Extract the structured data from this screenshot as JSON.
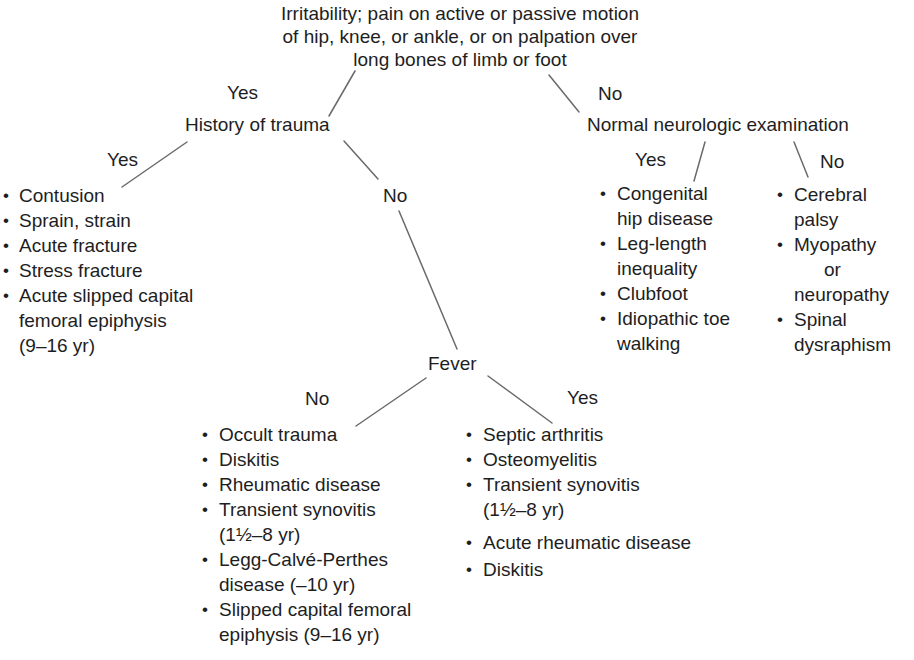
{
  "diagram": {
    "root": {
      "lines": [
        "Irritability; pain on active or passive motion",
        "of hip, knee, or ankle, or on palpation over",
        "long bones of limb or foot"
      ]
    },
    "trauma": {
      "branch_label": "Yes",
      "title": "History of trauma",
      "yes": {
        "label": "Yes",
        "items": [
          {
            "lines": [
              "Contusion"
            ]
          },
          {
            "lines": [
              "Sprain, strain"
            ]
          },
          {
            "lines": [
              "Acute fracture"
            ]
          },
          {
            "lines": [
              "Stress fracture"
            ]
          },
          {
            "lines": [
              "Acute slipped capital",
              "femoral epiphysis",
              "(9–16 yr)"
            ]
          }
        ]
      },
      "no": {
        "label": "No"
      }
    },
    "fever": {
      "title": "Fever",
      "no": {
        "label": "No",
        "items": [
          {
            "lines": [
              "Occult trauma"
            ]
          },
          {
            "lines": [
              "Diskitis"
            ]
          },
          {
            "lines": [
              "Rheumatic disease"
            ]
          },
          {
            "lines": [
              "Transient synovitis",
              "(1½–8 yr)"
            ]
          },
          {
            "lines": [
              "Legg-Calvé-Perthes",
              "disease (–10 yr)"
            ]
          },
          {
            "lines": [
              "Slipped capital femoral",
              "epiphysis (9–16 yr)"
            ]
          }
        ]
      },
      "yes": {
        "label": "Yes",
        "items": [
          {
            "lines": [
              "Septic arthritis"
            ]
          },
          {
            "lines": [
              "Osteomyelitis"
            ]
          },
          {
            "lines": [
              "Transient synovitis",
              "(1½–8 yr)"
            ]
          },
          {
            "lines": [
              "Acute rheumatic disease"
            ]
          },
          {
            "lines": [
              "Diskitis"
            ]
          }
        ]
      }
    },
    "neuro": {
      "branch_label": "No",
      "title": "Normal neurologic examination",
      "yes": {
        "label": "Yes",
        "items": [
          {
            "lines": [
              "Congenital",
              "hip disease"
            ]
          },
          {
            "lines": [
              "Leg-length",
              "inequality"
            ]
          },
          {
            "lines": [
              "Clubfoot"
            ]
          },
          {
            "lines": [
              "Idiopathic toe",
              "walking"
            ]
          }
        ]
      },
      "no": {
        "label": "No",
        "items": [
          {
            "lines": [
              "Cerebral",
              "palsy"
            ]
          },
          {
            "lines": [
              "Myopathy",
              "or",
              "neuropathy"
            ]
          },
          {
            "lines": [
              "Spinal",
              "dysraphism"
            ]
          }
        ]
      }
    },
    "colors": {
      "text": "#1e1e1e",
      "line": "#6a6a6a",
      "background": "#ffffff"
    }
  }
}
